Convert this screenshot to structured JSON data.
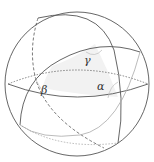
{
  "diagram": {
    "labels": {
      "alpha": "α",
      "beta": "β",
      "gamma": "γ"
    },
    "colors": {
      "stroke": "#555555",
      "faint": "#999999",
      "fill": "#f0f0f0"
    }
  }
}
